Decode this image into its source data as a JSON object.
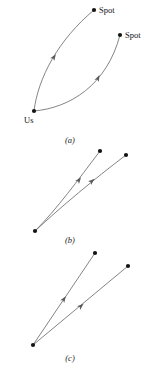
{
  "figure": {
    "width": 161,
    "height": 374,
    "background_color": "#ffffff",
    "curve_color": "#6e6e6e",
    "dot_color": "#141414",
    "label_color": "#111111",
    "arrow_color": "#5a5a5a"
  },
  "labels": {
    "us": "Us",
    "spot_upper": "Spot",
    "spot_lower": "Spot"
  },
  "captions": {
    "a": "(a)",
    "b": "(b)",
    "c": "(c)"
  },
  "chart_data": {
    "type": "diagram",
    "title": "",
    "panels": [
      {
        "id": "a",
        "caption": "(a)",
        "caption_pos": [
          70,
          143
        ],
        "description": "Two curved trajectories from the point labelled Us to two points each labelled Spot",
        "nodes": [
          {
            "name": "Us",
            "x": 34,
            "y": 111,
            "label": "Us",
            "label_x": 24,
            "label_y": 123
          },
          {
            "name": "Spot-upper",
            "x": 94,
            "y": 10,
            "label": "Spot",
            "label_x": 99,
            "label_y": 13
          },
          {
            "name": "Spot-lower",
            "x": 120,
            "y": 35,
            "label": "Spot",
            "label_x": 125,
            "label_y": 38
          }
        ],
        "curves": [
          {
            "from": "Us",
            "to": "Spot-upper",
            "path": "M 34 111 C 38 78 58 40 94 10",
            "arrow": {
              "x": 54,
              "y": 57,
              "angle": -56
            }
          },
          {
            "from": "Us",
            "to": "Spot-lower",
            "path": "M 34 111 C 70 108 107 85 120 35",
            "arrow": {
              "x": 98,
              "y": 78,
              "angle": -65
            }
          }
        ]
      },
      {
        "id": "b",
        "caption": "(b)",
        "caption_pos": [
          70,
          243
        ],
        "description": "Two trajectories from a common lower-left origin, one steep and nearly straight, one shallower and curved",
        "nodes": [
          {
            "name": "origin",
            "x": 35,
            "y": 231,
            "label": "",
            "label_x": 0,
            "label_y": 0
          },
          {
            "name": "target-upper",
            "x": 100,
            "y": 151,
            "label": "",
            "label_x": 0,
            "label_y": 0
          },
          {
            "name": "target-right",
            "x": 126,
            "y": 155,
            "label": "",
            "label_x": 0,
            "label_y": 0
          }
        ],
        "curves": [
          {
            "from": "origin",
            "to": "target-upper",
            "path": "M 35 231 C 57 209 78 180 100 151",
            "arrow": {
              "x": 79,
              "y": 180,
              "angle": -53
            }
          },
          {
            "from": "origin",
            "to": "target-right",
            "path": "M 35 231 C 62 206 93 180 126 155",
            "arrow": {
              "x": 92,
              "y": 181,
              "angle": -39
            }
          }
        ]
      },
      {
        "id": "c",
        "caption": "(c)",
        "caption_pos": [
          70,
          361
        ],
        "description": "Two straight rays from a common lower-left origin",
        "nodes": [
          {
            "name": "origin",
            "x": 33,
            "y": 345,
            "label": "",
            "label_x": 0,
            "label_y": 0
          },
          {
            "name": "target-upper",
            "x": 95,
            "y": 253,
            "label": "",
            "label_x": 0,
            "label_y": 0
          },
          {
            "name": "target-right",
            "x": 128,
            "y": 266,
            "label": "",
            "label_x": 0,
            "label_y": 0
          }
        ],
        "curves": [
          {
            "from": "origin",
            "to": "target-upper",
            "path": "M 33 345 L 95 253",
            "arrow": {
              "x": 64,
              "y": 299,
              "angle": -56
            }
          },
          {
            "from": "origin",
            "to": "target-right",
            "path": "M 33 345 L 128 266",
            "arrow": {
              "x": 81,
              "y": 306,
              "angle": -40
            }
          }
        ]
      }
    ]
  }
}
